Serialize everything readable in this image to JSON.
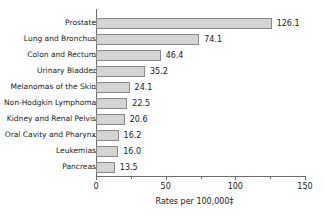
{
  "chart_data": {
    "type": "bar",
    "orientation": "horizontal",
    "title": "",
    "xlabel": "Rates per 100,000‡",
    "ylabel": "",
    "xlim": [
      0,
      150
    ],
    "xticks": [
      0,
      25,
      50,
      75,
      100,
      125,
      150
    ],
    "xtick_labels": [
      "0",
      "",
      "50",
      "",
      "100",
      "",
      "150"
    ],
    "grid": false,
    "legend": null,
    "categories": [
      "Prostate",
      "Lung and Bronchus",
      "Colon and Rectum",
      "Urinary Bladder",
      "Melanomas of the Skin",
      "Non-Hodgkin Lymphoma",
      "Kidney and Renal Pelvis",
      "Oral Cavity and Pharynx",
      "Leukemias",
      "Pancreas"
    ],
    "values": [
      126.1,
      74.1,
      46.4,
      35.2,
      24.1,
      22.5,
      20.6,
      16.2,
      16.0,
      13.5
    ],
    "value_labels": [
      "126.1",
      "74.1",
      "46.4",
      "35.2",
      "24.1",
      "22.5",
      "20.6",
      "16.2",
      "16.0",
      "13.5"
    ],
    "bar_color": "#d4d4d4",
    "bar_border_color": "#8a8a8a",
    "axis_color": "#6d6d6d",
    "background_color": "#ffffff",
    "text_color": "#1a1a1a"
  }
}
